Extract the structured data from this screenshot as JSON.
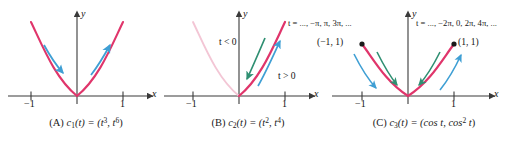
{
  "figure": {
    "type": "math-figure",
    "colors": {
      "curve": "#e0356b",
      "curve_faded": "#f3c6d5",
      "arrow_blue": "#3f9fd4",
      "arrow_green": "#2f8f72",
      "axis": "#3a3a3a",
      "text": "#151515"
    }
  },
  "panels": [
    {
      "id": "A",
      "caption_prefix": "(A)",
      "caption_fn": "c",
      "caption_sub": "1",
      "caption_body": "(t) = (t",
      "caption_sup1": "3",
      "caption_mid": ", t",
      "caption_sup2": "6",
      "caption_end": ")",
      "caption_plain": "(A) c1(t) = (t3, t6)",
      "x_axis_label": "x",
      "y_axis_label": "y",
      "tick_left": "−1",
      "tick_right": "1",
      "arrows": [
        {
          "name": "left-branch-arrow",
          "color": "arrow_blue",
          "direction": "down-right"
        },
        {
          "name": "right-branch-arrow",
          "color": "arrow_blue",
          "direction": "up-right"
        }
      ]
    },
    {
      "id": "B",
      "caption_prefix": "(B)",
      "caption_fn": "c",
      "caption_sub": "2",
      "caption_body": "(t) = (t",
      "caption_sup1": "2",
      "caption_mid": ", t",
      "caption_sup2": "4",
      "caption_end": ")",
      "caption_plain": "(B) c2(t) = (t2, t4)",
      "x_axis_label": "x",
      "y_axis_label": "y",
      "tick_left": "−1",
      "tick_right": "1",
      "label_t_negative": "t < 0",
      "label_t_positive": "t > 0",
      "arrows": [
        {
          "name": "t-negative-arrow",
          "color": "arrow_green",
          "direction": "down-left"
        },
        {
          "name": "t-positive-arrow",
          "color": "arrow_blue",
          "direction": "up-right"
        }
      ]
    },
    {
      "id": "C",
      "caption_prefix": "(C)",
      "caption_fn": "c",
      "caption_sub": "3",
      "caption_body": "(t) = (cos t, cos",
      "caption_sup1": "2",
      "caption_mid": " t",
      "caption_end": ")",
      "caption_plain": "(C) c3(t) = (cos t, cos2 t)",
      "x_axis_label": "x",
      "y_axis_label": "y",
      "tick_left": "−1",
      "tick_right": "1",
      "t_label_left": "t = ..., −π, π, 3π, ...",
      "t_label_right": "t = ..., −2π, 0, 2π, 4π, ...",
      "point_label_left": "(−1, 1)",
      "point_label_right": "(1, 1)",
      "arrows": [
        {
          "name": "left-inner-arrow",
          "color": "arrow_green",
          "direction": "down-right"
        },
        {
          "name": "left-outer-arrow",
          "color": "arrow_blue",
          "direction": "down-right"
        },
        {
          "name": "right-inner-arrow",
          "color": "arrow_green",
          "direction": "down-left"
        },
        {
          "name": "right-outer-arrow",
          "color": "arrow_blue",
          "direction": "up-right"
        }
      ]
    }
  ]
}
